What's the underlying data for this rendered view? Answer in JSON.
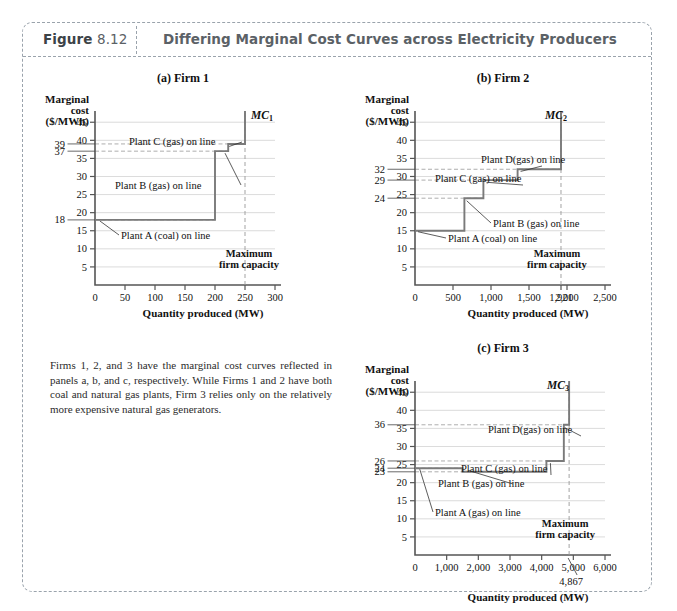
{
  "figure": {
    "label_word": "Figure",
    "number": "8.12",
    "title": "Differing Marginal Cost Curves across Electricity Producers",
    "caption": "Firms 1, 2, and 3 have the marginal cost curves reflected in panels a, b, and c, respectively. While Firms 1 and 2 have both coal and natural gas plants, Firm 3 relies only on the relatively more expensive natural gas generators.",
    "colors": {
      "frame_border": "#9aa3ac",
      "header_text": "#5b6166",
      "curve": "#7a7a7a",
      "axis": "#555555",
      "gridline": "#cccccc",
      "dashed_guide": "#999999"
    }
  },
  "chart_data": [
    {
      "type": "line",
      "panel": "(a) Firm 1",
      "title": "(a) Firm 1",
      "ylabel": "Marginal cost ($/MWh)",
      "xlabel": "Quantity produced (MW)",
      "series_name": "MC",
      "series_label": "MC",
      "series_subscript": "1",
      "xlim": [
        0,
        300
      ],
      "ylim": [
        0,
        47
      ],
      "xticks": [
        0,
        50,
        100,
        150,
        200,
        250,
        300
      ],
      "xticklabels": [
        "0",
        "50",
        "100",
        "150",
        "200",
        "250",
        "300"
      ],
      "yticks": [
        5,
        10,
        15,
        20,
        25,
        30,
        35,
        40,
        45
      ],
      "yticklabels": [
        "5",
        "10",
        "15",
        "20",
        "25",
        "30",
        "35",
        "40",
        "45"
      ],
      "special_yvalues": [
        39,
        37,
        18
      ],
      "special_ylabels": [
        "39",
        "37",
        "18"
      ],
      "grid": true,
      "steps": [
        {
          "x_start": 0,
          "x_end": 200,
          "y": 18,
          "plant": "Plant A (coal) on line"
        },
        {
          "x_start": 200,
          "x_end": 222,
          "y": 37,
          "plant": "Plant B (gas) on line"
        },
        {
          "x_start": 222,
          "x_end": 250,
          "y": 39,
          "plant": "Plant C (gas) on line"
        }
      ],
      "capacity_line_x": 250,
      "capacity_note": "Maximum firm capacity",
      "annotations": [
        {
          "text": "Plant C (gas) on line",
          "target_x": 222,
          "target_y": 39
        },
        {
          "text": "Plant B (gas) on line",
          "target_x": 205,
          "target_y": 37
        },
        {
          "text": "Plant A (coal) on line",
          "target_x": 10,
          "target_y": 18
        }
      ]
    },
    {
      "type": "line",
      "panel": "(b) Firm 2",
      "title": "(b) Firm 2",
      "ylabel": "Marginal cost ($/MWh)",
      "xlabel": "Quantity produced (MW)",
      "series_name": "MC",
      "series_label": "MC",
      "series_subscript": "2",
      "xlim": [
        0,
        2500
      ],
      "ylim": [
        0,
        47
      ],
      "xticks": [
        0,
        500,
        1000,
        1500,
        1921,
        2000,
        2500
      ],
      "xticklabels": [
        "0",
        "500",
        "1,000",
        "1,500",
        "1,921",
        "2,000",
        "2,500"
      ],
      "yticks": [
        5,
        10,
        15,
        20,
        25,
        30,
        35,
        40,
        45
      ],
      "yticklabels": [
        "5",
        "10",
        "15",
        "20",
        "25",
        "30",
        "35",
        "40",
        "45"
      ],
      "special_yvalues": [
        32,
        29,
        24
      ],
      "special_ylabels": [
        "32",
        "29",
        "24"
      ],
      "grid": true,
      "steps": [
        {
          "x_start": 0,
          "x_end": 650,
          "y": 15,
          "plant": "Plant A (coal) on line"
        },
        {
          "x_start": 650,
          "x_end": 900,
          "y": 24,
          "plant": "Plant B (gas) on line"
        },
        {
          "x_start": 900,
          "x_end": 1350,
          "y": 29,
          "plant": "Plant C (gas) on line"
        },
        {
          "x_start": 1350,
          "x_end": 1921,
          "y": 32,
          "plant": "Plant D(gas) on line"
        }
      ],
      "capacity_line_x": 1921,
      "capacity_note": "Maximum firm capacity",
      "annotations": [
        {
          "text": "Plant D(gas) on line",
          "target_x": 1350,
          "target_y": 32
        },
        {
          "text": "Plant C (gas) on line",
          "target_x": 900,
          "target_y": 29
        },
        {
          "text": "Plant B (gas) on line",
          "target_x": 680,
          "target_y": 23
        },
        {
          "text": "Plant A (coal) on line",
          "target_x": 40,
          "target_y": 15
        }
      ]
    },
    {
      "type": "line",
      "panel": "(c) Firm 3",
      "title": "(c) Firm 3",
      "ylabel": "Marginal cost ($/MWh)",
      "xlabel": "Quantity produced (MW)",
      "series_name": "MC",
      "series_label": "MC",
      "series_subscript": "3",
      "xlim": [
        0,
        6000
      ],
      "ylim": [
        0,
        47
      ],
      "xticks": [
        0,
        1000,
        2000,
        3000,
        4000,
        5000,
        6000
      ],
      "xticklabels": [
        "0",
        "1,000",
        "2,000",
        "3,000",
        "4,000",
        "5,000",
        "6,000"
      ],
      "yticks": [
        5,
        10,
        15,
        20,
        25,
        30,
        35,
        40,
        45
      ],
      "yticklabels": [
        "5",
        "10",
        "15",
        "20",
        "25",
        "30",
        "35",
        "40",
        "45"
      ],
      "special_yvalues": [
        36,
        26,
        24,
        23
      ],
      "special_ylabels": [
        "36",
        "26",
        "24",
        "23"
      ],
      "grid": true,
      "steps": [
        {
          "x_start": 0,
          "x_end": 1500,
          "y": 24,
          "plant": "Plant A (gas) on line"
        },
        {
          "x_start": 1500,
          "x_end": 4150,
          "y": 23,
          "plant": "Plant B (gas) on line"
        },
        {
          "x_start": 4150,
          "x_end": 4700,
          "y": 26,
          "plant": "Plant C (gas) on line"
        },
        {
          "x_start": 4700,
          "x_end": 4867,
          "y": 36,
          "plant": "Plant D(gas) on line"
        }
      ],
      "capacity_line_x": 4867,
      "capacity_label": "4,867",
      "capacity_note": "Maximum firm capacity",
      "annotations": [
        {
          "text": "Plant D(gas) on line",
          "target_x": 4700,
          "target_y": 36
        },
        {
          "text": "Plant C (gas) on line",
          "target_x": 4200,
          "target_y": 26
        },
        {
          "text": "Plant B (gas) on line",
          "target_x": 1550,
          "target_y": 23
        },
        {
          "text": "Plant A (gas) on line",
          "target_x": 200,
          "target_y": 24
        }
      ]
    }
  ]
}
